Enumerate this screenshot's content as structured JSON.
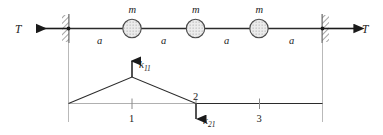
{
  "figure": {
    "colors": {
      "ink": "#1a1a1a",
      "line": "#2b2b2b",
      "guide": "#b9b9b9",
      "mass_fill": "#e2e2e2",
      "mass_stroke": "#4a4a4a",
      "wall_hatch": "#5a5a5a",
      "background": "#ffffff"
    }
  },
  "upper_diagram": {
    "name": "taut-string-with-masses",
    "tension_left_label": "T",
    "tension_right_label": "T",
    "mass_labels": [
      "m",
      "m",
      "m"
    ],
    "span_labels": [
      "a",
      "a",
      "a",
      "a"
    ],
    "mass_count": 3,
    "span_count": 4,
    "supports": [
      "fixed-wall-left",
      "fixed-wall-right"
    ]
  },
  "lower_diagram": {
    "name": "influence-coefficient-deflection",
    "station_labels": [
      "1",
      "2",
      "3"
    ],
    "force_up_label": "k",
    "force_up_subscript": "11",
    "force_down_label": "k",
    "force_down_subscript": "21",
    "node_label": "2",
    "description": "Unit deflection at station 1 producing forces k11 upward at 1 and k21 downward at 2"
  }
}
